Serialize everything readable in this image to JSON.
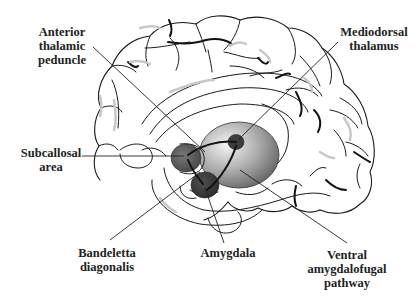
{
  "diagram": {
    "labels": {
      "anterior_thalamic_peduncle": [
        "Anterior",
        "thalamic",
        "peduncle"
      ],
      "mediodorsal_thalamus": [
        "Mediodorsal",
        "thalamus"
      ],
      "subcallosal_area": [
        "Subcallosal",
        "area"
      ],
      "bandeletta_diagonalis": [
        "Bandeletta",
        "diagonalis"
      ],
      "amygdala": [
        "Amygdala"
      ],
      "ventral_amygdalofugal_pathway": [
        "Ventral",
        "amygdalofugal",
        "pathway"
      ]
    },
    "colors": {
      "line": "#1a1a1a",
      "thalamus_light": "#e8e8e8",
      "thalamus_dark": "#6a6a6a",
      "subcallosal_fill": "#5a5a5a",
      "amygdala_fill": "#3a3a3a",
      "md_nucleus_fill": "#3c3c3c"
    }
  }
}
